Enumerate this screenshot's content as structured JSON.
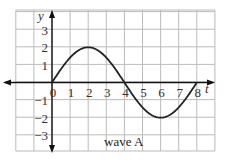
{
  "chart_data": {
    "type": "line",
    "title": "wave A",
    "xlabel": "t",
    "ylabel": "y",
    "xlim": [
      -2,
      9
    ],
    "ylim": [
      -3.8,
      4.2
    ],
    "grid": true,
    "xticks": [
      "0",
      "1",
      "2",
      "3",
      "4",
      "5",
      "6",
      "7",
      "8"
    ],
    "yticks": [
      "3",
      "2",
      "1",
      "-1",
      "-2",
      "-3"
    ],
    "series": [
      {
        "name": "wave A",
        "function": "y = 2 sin(2*pi*t/8)",
        "amplitude": 2,
        "period": 8,
        "x": [
          0,
          1,
          2,
          3,
          4,
          5,
          6,
          7,
          8
        ],
        "values": [
          0,
          1.41,
          2,
          1.41,
          0,
          -1.41,
          -2,
          -1.41,
          0
        ]
      }
    ],
    "colors": {
      "curve": "#222222",
      "grid": "#bbbbbb",
      "axes": "#111111"
    }
  }
}
